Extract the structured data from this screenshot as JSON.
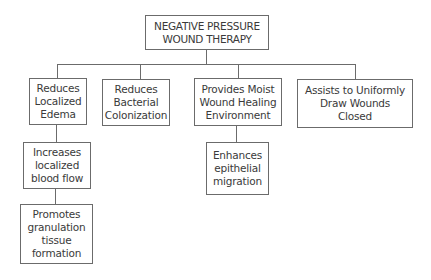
{
  "diagram": {
    "title": "NEGATIVE PRESSURE\nWOUND THERAPY",
    "colors": {
      "line": "#6b6b6b",
      "text": "#3a3a3a",
      "background": "#ffffff"
    },
    "nodes": {
      "root": {
        "label": "NEGATIVE PRESSURE\nWOUND THERAPY"
      },
      "edema": {
        "label": "Reduces\nLocalized\nEdema"
      },
      "bacterial": {
        "label": "Reduces\nBacterial\nColonization"
      },
      "moist": {
        "label": "Provides Moist\nWound Healing\nEnvironment"
      },
      "draw": {
        "label": "Assists to Uniformly\nDraw Wounds\nClosed"
      },
      "bloodflow": {
        "label": "Increases\nlocalized\nblood flow"
      },
      "granulation": {
        "label": "Promotes\ngranulation\ntissue\nformation"
      },
      "epithelial": {
        "label": "Enhances\nepithelial\nmigration"
      }
    },
    "edges": [
      {
        "from": "root",
        "to": "edema"
      },
      {
        "from": "root",
        "to": "bacterial"
      },
      {
        "from": "root",
        "to": "moist"
      },
      {
        "from": "root",
        "to": "draw"
      },
      {
        "from": "edema",
        "to": "bloodflow"
      },
      {
        "from": "bloodflow",
        "to": "granulation"
      },
      {
        "from": "moist",
        "to": "epithelial"
      }
    ]
  }
}
